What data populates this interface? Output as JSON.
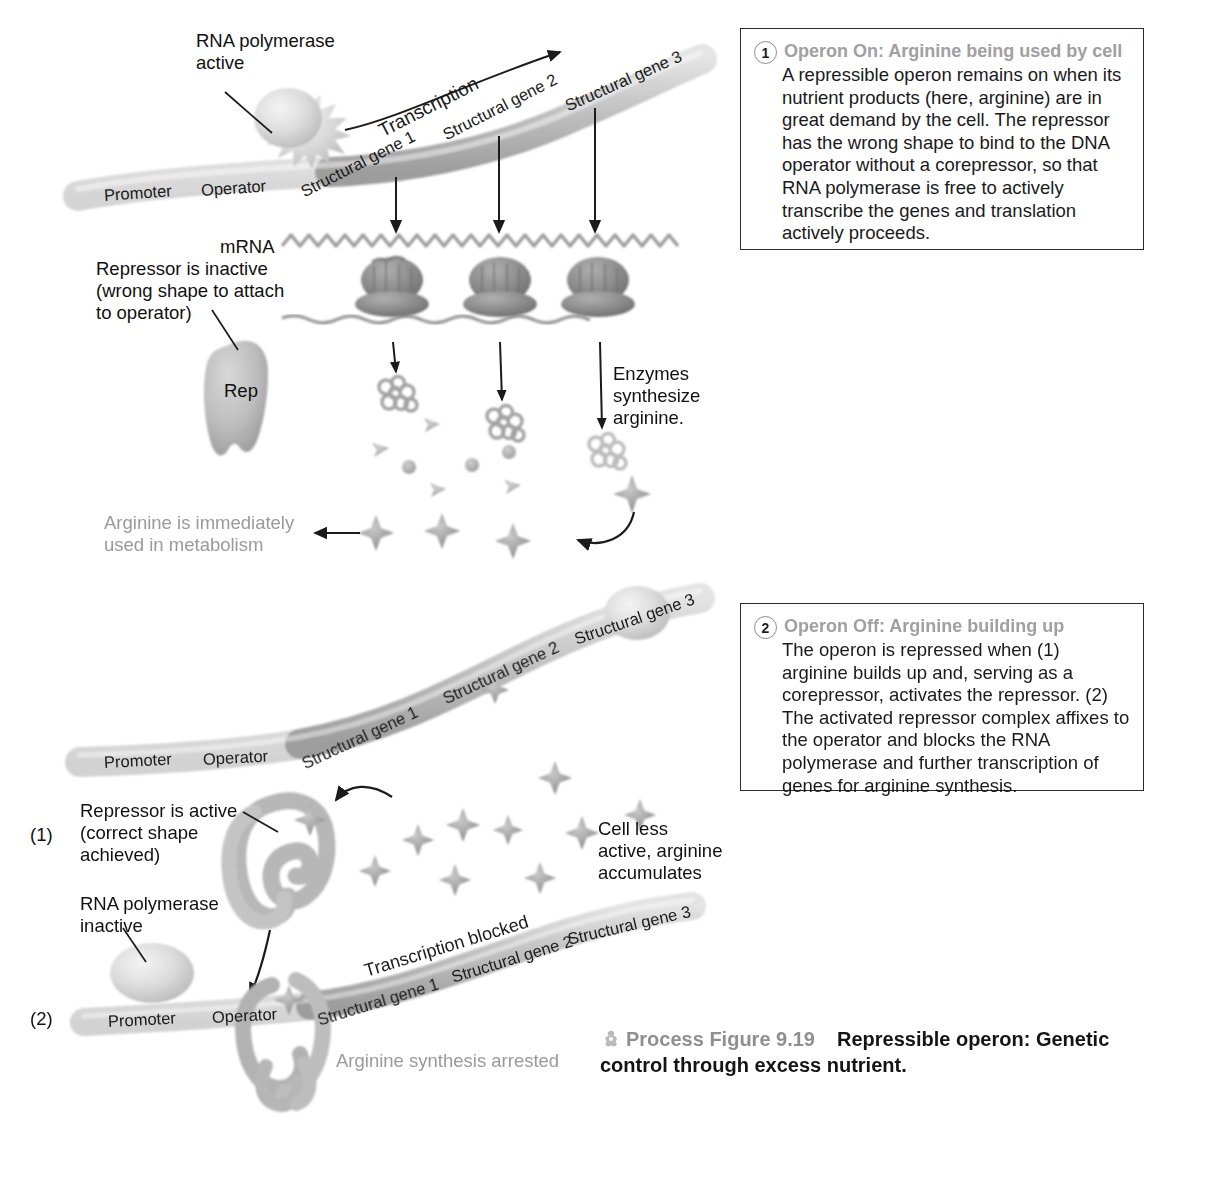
{
  "figure": {
    "icon": "process-figure-icon",
    "number_label": "Process Figure 9.19",
    "description": "Repressible operon: Genetic control through excess nutrient."
  },
  "callouts": [
    {
      "number": "1",
      "title": "Operon On: Arginine being used by cell",
      "body": "A repressible operon remains on when its nutrient products (here, arginine) are in great demand by the cell. The repressor has the wrong shape to bind to the DNA operator without a corepressor, so that RNA polymerase is free to actively transcribe the genes and translation actively proceeds."
    },
    {
      "number": "2",
      "title": "Operon Off: Arginine building up",
      "body": "The operon is repressed when (1) arginine builds up and, serving as a corepressor, activates the repressor. (2) The activated repressor complex affixes to the operator and blocks the RNA polymerase and further transcription of genes for arginine synthesis."
    }
  ],
  "panel_on": {
    "rna_polymerase_label": "RNA polymerase\nactive",
    "transcription_label": "Transcription",
    "dna_segments": [
      "Promoter",
      "Operator",
      "Structural gene 1",
      "Structural gene 2",
      "Structural gene 3"
    ],
    "mrna_label": "mRNA",
    "repressor_label": "Repressor is inactive\n(wrong shape to attach\nto operator)",
    "repressor_tag": "Rep",
    "enzymes_label": "Enzymes\nsynthesize\narginine.",
    "arginine_used_label": "Arginine is immediately\nused in metabolism"
  },
  "panel_off": {
    "dna_segments_top": [
      "Promoter",
      "Operator",
      "Structural gene 1",
      "Structural gene 2",
      "Structural gene 3"
    ],
    "step1_marker": "(1)",
    "step2_marker": "(2)",
    "repressor_active_label": "Repressor is active\n(correct shape\nachieved)",
    "rna_polymerase_inactive_label": "RNA polymerase\ninactive",
    "cell_less_active_label": "Cell less\nactive, arginine\naccumulates",
    "transcription_blocked_label": "Transcription blocked",
    "dna_segments_bottom": [
      "Promoter",
      "Operator",
      "Structural gene 1",
      "Structural gene 2",
      "Structural gene 3"
    ],
    "arginine_arrested_label": "Arginine synthesis arrested"
  },
  "colors": {
    "dna_light": "#e6e6e6",
    "dna_dark": "#bdbdbd",
    "ribosome": "#8a8a8a",
    "repressor": "#b5b5b5",
    "arginine_star": "#9e9e9e",
    "gray_text": "#9a9a9a",
    "border": "#2b2b2b"
  }
}
